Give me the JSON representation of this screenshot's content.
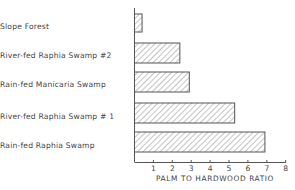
{
  "chart_data": {
    "type": "bar",
    "orientation": "horizontal",
    "title": "",
    "xlabel": "PALM  TO  HARDWOOD  RATIO",
    "ylabel": "",
    "categories": [
      "Slope  Forest",
      "River-fed  Raphia  Swamp #2",
      "Rain-fed  Manicaria  Swamp",
      "River-fed  Raphia  Swamp # 1",
      "Rain-fed  Raphia  Swamp"
    ],
    "values": [
      0.4,
      2.4,
      2.9,
      5.3,
      6.9
    ],
    "xlim": [
      0,
      8
    ],
    "xticks": [
      "1",
      "2",
      "3",
      "4",
      "5",
      "6",
      "7",
      "8"
    ],
    "grid": false,
    "legend": "none",
    "bar_fill": "diagonal-hatch",
    "colors": {
      "line": "#555555",
      "hatch": "#777777",
      "background": "#ffffff"
    }
  }
}
